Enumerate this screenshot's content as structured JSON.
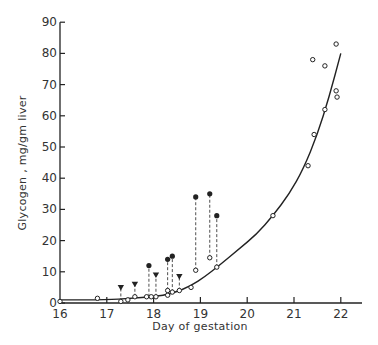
{
  "chart_data": {
    "type": "scatter",
    "title": "",
    "xlabel": "Day of gestation",
    "ylabel": "Glycogen , mg/gm liver",
    "xlim": [
      16,
      22.4
    ],
    "ylim": [
      0,
      90
    ],
    "x_ticks": [
      "16",
      "17",
      "18",
      "19",
      "20",
      "21",
      "22"
    ],
    "y_ticks": [
      "0",
      "10",
      "20",
      "30",
      "40",
      "50",
      "60",
      "70",
      "80",
      "90"
    ],
    "grid": false,
    "legend": null,
    "series": [
      {
        "name": "open circles",
        "marker": "open-circle",
        "points": [
          [
            16.0,
            0.5
          ],
          [
            16.8,
            1.5
          ],
          [
            17.3,
            0.5
          ],
          [
            17.45,
            1.0
          ],
          [
            17.6,
            2.0
          ],
          [
            17.85,
            2.0
          ],
          [
            17.95,
            2.0
          ],
          [
            18.05,
            2.0
          ],
          [
            18.3,
            2.5
          ],
          [
            18.3,
            4.0
          ],
          [
            18.4,
            3.5
          ],
          [
            18.55,
            4.0
          ],
          [
            18.8,
            5.0
          ],
          [
            18.9,
            10.5
          ],
          [
            19.2,
            14.5
          ],
          [
            19.35,
            11.5
          ],
          [
            20.55,
            28.0
          ],
          [
            21.3,
            44.0
          ],
          [
            21.43,
            54.0
          ],
          [
            21.4,
            78.0
          ],
          [
            21.66,
            76.0
          ],
          [
            21.66,
            62.0
          ],
          [
            21.9,
            83.0
          ],
          [
            21.9,
            68.0
          ],
          [
            21.92,
            66.0
          ]
        ]
      },
      {
        "name": "filled circles",
        "marker": "filled-circle",
        "points": [
          [
            17.9,
            12.0
          ],
          [
            18.3,
            14.0
          ],
          [
            18.4,
            15.0
          ],
          [
            18.9,
            34.0
          ],
          [
            19.2,
            35.0
          ],
          [
            19.35,
            28.0
          ]
        ]
      },
      {
        "name": "filled triangles",
        "marker": "filled-triangle-down",
        "points": [
          [
            17.3,
            5.0
          ],
          [
            17.6,
            6.0
          ],
          [
            18.05,
            9.0
          ],
          [
            18.55,
            8.5
          ]
        ]
      },
      {
        "name": "fitted curve",
        "type": "line",
        "points": [
          [
            16.0,
            1.0
          ],
          [
            17.0,
            1.0
          ],
          [
            17.5,
            1.5
          ],
          [
            18.0,
            2.0
          ],
          [
            18.4,
            3.0
          ],
          [
            18.8,
            5.5
          ],
          [
            19.1,
            8.5
          ],
          [
            19.4,
            12.0
          ],
          [
            19.8,
            17.0
          ],
          [
            20.2,
            22.0
          ],
          [
            20.55,
            28.0
          ],
          [
            20.9,
            35.0
          ],
          [
            21.2,
            43.0
          ],
          [
            21.5,
            54.0
          ],
          [
            21.75,
            66.0
          ],
          [
            22.0,
            80.0
          ]
        ]
      }
    ],
    "connectors": [
      {
        "from": [
          17.9,
          2.0
        ],
        "to": [
          17.9,
          12.0
        ],
        "style": "dashed"
      },
      {
        "from": [
          18.3,
          2.5
        ],
        "to": [
          18.3,
          14.0
        ],
        "style": "dashed"
      },
      {
        "from": [
          18.4,
          3.5
        ],
        "to": [
          18.4,
          15.0
        ],
        "style": "dashed"
      },
      {
        "from": [
          18.9,
          10.5
        ],
        "to": [
          18.9,
          34.0
        ],
        "style": "dashed"
      },
      {
        "from": [
          19.2,
          14.5
        ],
        "to": [
          19.2,
          35.0
        ],
        "style": "dashed"
      },
      {
        "from": [
          19.35,
          11.5
        ],
        "to": [
          19.35,
          28.0
        ],
        "style": "dashed"
      },
      {
        "from": [
          17.3,
          0.5
        ],
        "to": [
          17.3,
          5.0
        ],
        "style": "dashed"
      },
      {
        "from": [
          17.6,
          2.0
        ],
        "to": [
          17.6,
          6.0
        ],
        "style": "dashed"
      },
      {
        "from": [
          18.05,
          2.0
        ],
        "to": [
          18.05,
          9.0
        ],
        "style": "dashed"
      },
      {
        "from": [
          18.55,
          4.0
        ],
        "to": [
          18.55,
          8.5
        ],
        "style": "dashed"
      }
    ]
  },
  "colors": {
    "ink": "#222222",
    "background": "#ffffff"
  }
}
